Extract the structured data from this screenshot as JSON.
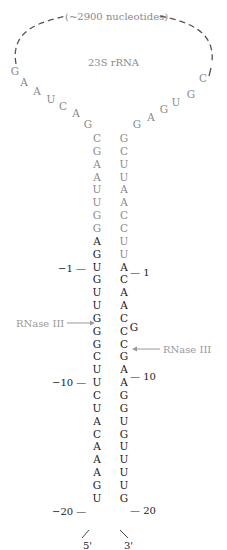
{
  "diagram": {
    "loop_label": "(~2900 nucleotides)",
    "rna_label": "23S rRNA",
    "enzyme_label_left": "RNase III",
    "enzyme_label_right": "RNase III",
    "five_prime": "5'",
    "three_prime": "3'",
    "loop_left": [
      "G",
      "A",
      "A",
      "U",
      "C",
      "A",
      "G"
    ],
    "loop_right": [
      "G",
      "A",
      "G",
      "U",
      "G",
      "C"
    ],
    "left_stem": [
      "C",
      "G",
      "A",
      "A",
      "U",
      "U",
      "G",
      "G",
      "A",
      "G",
      "U",
      "G",
      "U",
      "U",
      "G",
      "G",
      "G",
      "C",
      "U",
      "U",
      "C",
      "U",
      "A",
      "C",
      "A",
      "A",
      "A",
      "G",
      "U"
    ],
    "right_stem": [
      "G",
      "C",
      "U",
      "U",
      "A",
      "A",
      "C",
      "C",
      "U",
      "U",
      "A",
      "C",
      "A",
      "A",
      "C",
      "C",
      "C",
      "G",
      "A",
      "A",
      "G",
      "G",
      "U",
      "G",
      "U",
      "U",
      "U",
      "U",
      "G"
    ],
    "bulge": "G",
    "position_labels": {
      "minus1": "−1 —",
      "minus10": "−10 —",
      "minus20": "−20 —",
      "plus1": "— 1",
      "plus10": "— 10",
      "plus20": "— 20"
    },
    "colors": {
      "mature_rna": "#8a8a8a",
      "precursor": "#1a1a1a",
      "arrow": "#9a9a9a"
    }
  }
}
